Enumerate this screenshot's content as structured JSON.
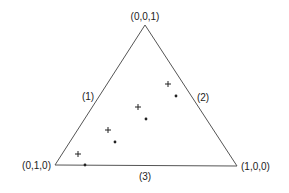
{
  "diagram": {
    "type": "ternary-simplex",
    "vertices": [
      {
        "id": "top",
        "label": "(0,0,1)",
        "x": 145,
        "y": 25
      },
      {
        "id": "left",
        "label": "(0,1,0)",
        "x": 55,
        "y": 165
      },
      {
        "id": "right",
        "label": "(1,0,0)",
        "x": 237,
        "y": 166
      }
    ],
    "edges": [
      {
        "id": "edge-1",
        "label": "(1)",
        "label_x": 88,
        "label_y": 100
      },
      {
        "id": "edge-2",
        "label": "(2)",
        "label_x": 203,
        "label_y": 101
      },
      {
        "id": "edge-3",
        "label": "(3)",
        "label_x": 145,
        "label_y": 180
      }
    ],
    "plus_markers": [
      {
        "x": 168,
        "y": 84
      },
      {
        "x": 138,
        "y": 107
      },
      {
        "x": 108,
        "y": 130
      },
      {
        "x": 78,
        "y": 154
      }
    ],
    "dot_markers": [
      {
        "x": 176,
        "y": 96
      },
      {
        "x": 146,
        "y": 119
      },
      {
        "x": 115,
        "y": 142
      },
      {
        "x": 85,
        "y": 165
      }
    ],
    "colors": {
      "line": "#555555",
      "marker": "#222222",
      "background": "#ffffff"
    }
  }
}
